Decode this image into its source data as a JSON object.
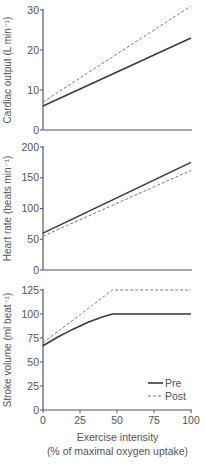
{
  "chart_data": [
    {
      "type": "line",
      "title": "",
      "xlabel": "",
      "ylabel": "Cardiac output (L min⁻¹)",
      "ylim": [
        0,
        30
      ],
      "yticks": [
        0,
        10,
        20,
        30
      ],
      "xlim": [
        0,
        100
      ],
      "grid": false,
      "series": [
        {
          "name": "Pre",
          "style": "solid",
          "x": [
            0,
            100
          ],
          "y": [
            6,
            23
          ]
        },
        {
          "name": "Post",
          "style": "dashed",
          "x": [
            0,
            100
          ],
          "y": [
            7,
            31
          ]
        }
      ]
    },
    {
      "type": "line",
      "title": "",
      "xlabel": "",
      "ylabel": "Heart rate (beats min⁻¹)",
      "ylim": [
        0,
        200
      ],
      "yticks": [
        0,
        50,
        100,
        150,
        200
      ],
      "xlim": [
        0,
        100
      ],
      "grid": false,
      "series": [
        {
          "name": "Pre",
          "style": "solid",
          "x": [
            0,
            100
          ],
          "y": [
            60,
            175
          ]
        },
        {
          "name": "Post",
          "style": "dashed",
          "x": [
            0,
            100
          ],
          "y": [
            55,
            162
          ]
        }
      ]
    },
    {
      "type": "line",
      "title": "",
      "xlabel": "Exercise intensity (% of maximal oxygen uptake)",
      "ylabel": "Stroke volume (ml beat⁻¹)",
      "ylim": [
        0,
        125
      ],
      "yticks": [
        0,
        25,
        50,
        75,
        100,
        125
      ],
      "xlim": [
        0,
        100
      ],
      "xticks": [
        0,
        25,
        50,
        75,
        100
      ],
      "grid": false,
      "legend": {
        "position": "lower right",
        "entries": [
          "Pre",
          "Post"
        ]
      },
      "series": [
        {
          "name": "Pre",
          "style": "solid",
          "x": [
            0,
            10,
            20,
            30,
            40,
            47,
            100
          ],
          "y": [
            67,
            76,
            84,
            91,
            97,
            100,
            100
          ]
        },
        {
          "name": "Post",
          "style": "dashed",
          "x": [
            0,
            47,
            100
          ],
          "y": [
            70,
            125,
            125
          ]
        }
      ]
    }
  ],
  "xaxis": {
    "label_line1": "Exercise intensity",
    "label_line2": "(% of maximal oxygen uptake)"
  },
  "legend": {
    "pre": "Pre",
    "post": "Post"
  },
  "colors": {
    "axis": "#555555",
    "pre": "#3a3a3a",
    "post": "#777777"
  }
}
